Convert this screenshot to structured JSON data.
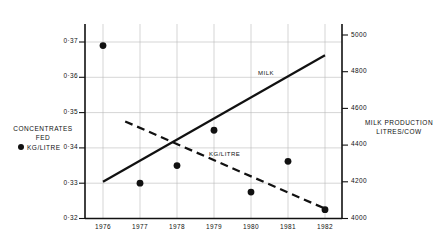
{
  "chart_data": {
    "type": "line",
    "title": "",
    "x": [
      1976,
      1977,
      1978,
      1979,
      1980,
      1981,
      1982
    ],
    "categories": [
      "1976",
      "1977",
      "1978",
      "1979",
      "1980",
      "1981",
      "1982"
    ],
    "grid": true,
    "legend_position": "inline",
    "left_axis": {
      "label_lines": [
        "CONCENTRATES",
        "FED"
      ],
      "unit_label": "KG/LITRE",
      "ticks": [
        "0·32",
        "0·33",
        "0·34",
        "0·35",
        "0·36",
        "0·37"
      ],
      "tick_values": [
        0.32,
        0.33,
        0.34,
        0.35,
        0.36,
        0.37
      ],
      "ylim": [
        0.32,
        0.37
      ]
    },
    "right_axis": {
      "label_lines": [
        "MILK PRODUCTION",
        "LITRES/COW"
      ],
      "ticks": [
        "4000",
        "4200",
        "4400",
        "4600",
        "4800",
        "5000"
      ],
      "tick_values": [
        4000,
        4200,
        4400,
        4600,
        4800,
        5000
      ],
      "ylim": [
        4000,
        5000
      ]
    },
    "series": [
      {
        "name": "MILK",
        "label": "MILK",
        "style": "solid",
        "axis": "right",
        "color": "#111111",
        "values": [
          4200,
          4315,
          4430,
          4545,
          4660,
          4775,
          4890
        ],
        "endpoints": {
          "x_start": 1976,
          "y_start": 4200,
          "x_end": 1982,
          "y_end": 4890
        }
      },
      {
        "name": "KG/LITRE trend",
        "label": "KG/LITRE",
        "style": "dashed",
        "axis": "left",
        "color": "#111111",
        "values": [
          null,
          0.3475,
          0.342,
          0.3358,
          0.3296,
          0.3237,
          0.3228
        ],
        "endpoints": {
          "x_start": 1976.6,
          "y_start": 0.3475,
          "x_end": 1982,
          "y_end": 0.3228
        }
      },
      {
        "name": "KG/LITRE points",
        "label": "KG/LITRE",
        "style": "markers",
        "axis": "left",
        "color": "#111111",
        "values": [
          0.369,
          0.33,
          0.335,
          0.345,
          0.3275,
          0.3362,
          0.3225
        ]
      }
    ]
  },
  "legend": {
    "left_title_line1": "CONCENTRATES",
    "left_title_line2": "FED",
    "left_marker_label": "KG/LITRE",
    "right_title_line1": "MILK PRODUCTION",
    "right_title_line2": "LITRES/COW"
  },
  "annotations": {
    "milk_label": "MILK",
    "kg_litre_label": "KG/LITRE"
  }
}
